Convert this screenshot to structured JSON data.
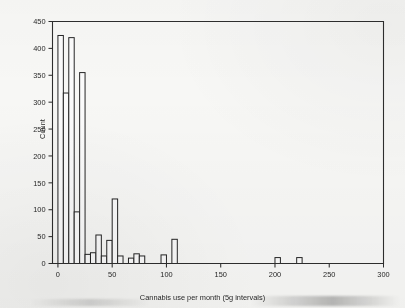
{
  "chart_data": {
    "type": "bar",
    "title": "",
    "subtitle": "",
    "xlabel": "Cannabis use per month (5g intervals)",
    "ylabel": "Count",
    "xlim": [
      -5,
      300
    ],
    "ylim": [
      0,
      450
    ],
    "grid": false,
    "legend": null,
    "bin_width": 5,
    "x_ticks": [
      0,
      50,
      100,
      150,
      200,
      250,
      300
    ],
    "x_tick_labels": [
      "0",
      "50",
      "100",
      "150",
      "200",
      "250",
      "300"
    ],
    "y_ticks": [
      0,
      50,
      100,
      150,
      200,
      250,
      300,
      350,
      400,
      450
    ],
    "y_tick_labels": [
      "0",
      "50",
      "100",
      "150",
      "200",
      "250",
      "300",
      "350",
      "400",
      "450"
    ],
    "bin_starts": [
      0,
      5,
      10,
      15,
      20,
      25,
      30,
      35,
      40,
      45,
      50,
      55,
      60,
      65,
      70,
      75,
      80,
      85,
      90,
      95,
      100,
      105,
      110,
      115,
      200,
      220
    ],
    "values": [
      424,
      317,
      420,
      96,
      355,
      17,
      20,
      53,
      14,
      43,
      120,
      14,
      0,
      10,
      18,
      14,
      0,
      0,
      0,
      16,
      0,
      45,
      0,
      0,
      11,
      11
    ],
    "categories": [
      "0-5",
      "5-10",
      "10-15",
      "15-20",
      "20-25",
      "30-35",
      "35-40",
      "40-45",
      "45-50",
      "50-55",
      "55-60",
      "60-65",
      "65-70",
      "70-75",
      "75-80",
      "80-85",
      "85-90",
      "90-95",
      "95-100",
      "100-105",
      "105-110",
      "110-115",
      "115-120",
      "120-125",
      "200-205",
      "220-225"
    ]
  },
  "axes": {
    "y_axis_label": "Count",
    "x_axis_label": "Cannabis use per month (5g intervals)"
  }
}
